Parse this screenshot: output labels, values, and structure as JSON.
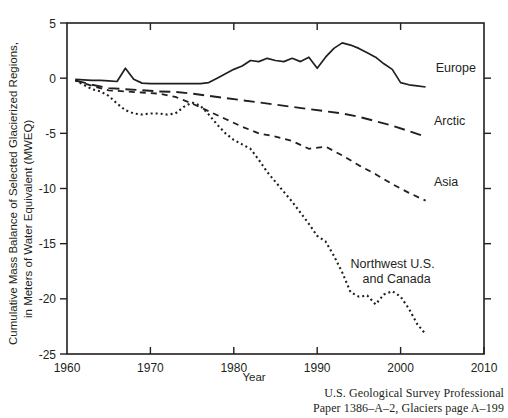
{
  "figure": {
    "source_note_line1": "U.S. Geological Survey Professional",
    "source_note_line2": "Paper 1386–A–2, Glaciers page A–199"
  },
  "chart_data": {
    "type": "line",
    "title": "",
    "xlabel": "Year",
    "ylabel": "Cumulative Mass Balance of Selected Glacierized Regions, in Meters of Water Equivalent (MWEQ)",
    "ylabel_line1": "Cumulative Mass Balance of Selected Glacierized Regions,",
    "ylabel_line2": "in Meters of Water Equivalent (MWEQ)",
    "xlim": [
      1960,
      2010
    ],
    "ylim": [
      -25,
      5
    ],
    "xticks": [
      1960,
      1970,
      1980,
      1990,
      2000,
      2010
    ],
    "xtick_labels": [
      "1960",
      "1970",
      "1980",
      "1990",
      "2000",
      "2010"
    ],
    "yticks": [
      5,
      0,
      -5,
      -10,
      -15,
      -20,
      -25
    ],
    "ytick_labels": [
      "5",
      "0",
      "-5",
      "-10",
      "-15",
      "-20",
      "-25"
    ],
    "grid": false,
    "legend_position": "inline-right",
    "line_color": "#231f20",
    "series": [
      {
        "name": "Europe",
        "label": "Europe",
        "style": "solid",
        "dash": "none",
        "width": 1.7,
        "label_x": 2004.2,
        "label_y": 0.6,
        "x": [
          1961,
          1962,
          1963,
          1964,
          1965,
          1966,
          1967,
          1968,
          1969,
          1970,
          1971,
          1972,
          1973,
          1974,
          1975,
          1976,
          1977,
          1978,
          1979,
          1980,
          1981,
          1982,
          1983,
          1984,
          1985,
          1986,
          1987,
          1988,
          1989,
          1990,
          1991,
          1992,
          1993,
          1994,
          1995,
          1996,
          1997,
          1998,
          1999,
          2000,
          2001,
          2002,
          2003
        ],
        "y": [
          -0.1,
          -0.15,
          -0.2,
          -0.2,
          -0.25,
          -0.3,
          0.9,
          -0.1,
          -0.45,
          -0.5,
          -0.5,
          -0.5,
          -0.5,
          -0.5,
          -0.5,
          -0.5,
          -0.4,
          0.0,
          0.4,
          0.8,
          1.1,
          1.6,
          1.5,
          1.8,
          1.6,
          1.5,
          1.8,
          1.5,
          1.9,
          0.9,
          1.9,
          2.7,
          3.2,
          3.0,
          2.7,
          2.3,
          1.9,
          1.3,
          0.8,
          -0.4,
          -0.6,
          -0.7,
          -0.8
        ]
      },
      {
        "name": "Arctic",
        "label": "Arctic",
        "style": "long-dash",
        "dash": "11,6",
        "width": 1.9,
        "label_x": 2004.0,
        "label_y": -4.2,
        "x": [
          1961,
          1963,
          1965,
          1967,
          1969,
          1971,
          1973,
          1975,
          1977,
          1979,
          1981,
          1983,
          1985,
          1987,
          1989,
          1991,
          1993,
          1995,
          1997,
          1999,
          2001,
          2003
        ],
        "y": [
          -0.2,
          -0.6,
          -0.9,
          -1.0,
          -1.1,
          -1.2,
          -1.25,
          -1.4,
          -1.6,
          -1.8,
          -2.0,
          -2.2,
          -2.4,
          -2.6,
          -2.8,
          -3.0,
          -3.2,
          -3.5,
          -3.9,
          -4.3,
          -4.8,
          -5.3
        ]
      },
      {
        "name": "Asia",
        "label": "Asia",
        "style": "dash",
        "dash": "6,5",
        "width": 1.8,
        "label_x": 2004.0,
        "label_y": -9.8,
        "x": [
          1961,
          1963,
          1965,
          1967,
          1969,
          1971,
          1973,
          1975,
          1977,
          1979,
          1981,
          1983,
          1985,
          1987,
          1989,
          1991,
          1993,
          1995,
          1997,
          1999,
          2001,
          2003
        ],
        "y": [
          -0.2,
          -0.7,
          -1.1,
          -1.2,
          -1.3,
          -1.4,
          -1.7,
          -2.3,
          -3.0,
          -3.7,
          -4.4,
          -5.0,
          -5.3,
          -5.7,
          -6.4,
          -6.2,
          -7.0,
          -7.9,
          -8.7,
          -9.6,
          -10.4,
          -11.1
        ]
      },
      {
        "name": "Northwest U.S. and Canada",
        "label_line1": "Northwest U.S.",
        "label_line2": "and Canada",
        "style": "dotted",
        "dash": "2,3",
        "width": 2.1,
        "label_x": 1994.0,
        "label_y": -17.2,
        "x": [
          1961,
          1962,
          1963,
          1964,
          1965,
          1966,
          1967,
          1968,
          1969,
          1970,
          1971,
          1972,
          1973,
          1974,
          1975,
          1976,
          1977,
          1978,
          1979,
          1980,
          1981,
          1982,
          1983,
          1984,
          1985,
          1986,
          1987,
          1988,
          1989,
          1990,
          1991,
          1992,
          1993,
          1994,
          1995,
          1996,
          1997,
          1998,
          1999,
          2000,
          2001,
          2002,
          2003
        ],
        "y": [
          -0.2,
          -0.6,
          -1.0,
          -1.2,
          -1.6,
          -2.3,
          -2.9,
          -3.2,
          -3.3,
          -3.2,
          -3.2,
          -3.3,
          -3.2,
          -2.6,
          -2.2,
          -2.5,
          -3.3,
          -4.2,
          -5.0,
          -5.6,
          -6.0,
          -6.4,
          -7.4,
          -8.5,
          -9.4,
          -10.3,
          -11.2,
          -12.2,
          -13.2,
          -14.3,
          -14.8,
          -16.1,
          -17.6,
          -19.4,
          -19.8,
          -19.7,
          -20.5,
          -19.6,
          -19.3,
          -19.8,
          -20.9,
          -22.3,
          -23.2
        ]
      }
    ]
  }
}
